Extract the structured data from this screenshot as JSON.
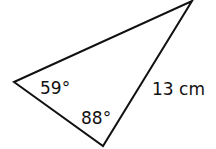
{
  "diagram": {
    "type": "triangle",
    "stroke_color": "#111111",
    "background": "#ffffff",
    "vertices": {
      "left": [
        14,
        82
      ],
      "top_right": [
        192,
        1
      ],
      "bottom": [
        103,
        146
      ]
    },
    "angles": [
      {
        "vertex": "left",
        "label": "59°"
      },
      {
        "vertex": "bottom",
        "label": "88°"
      }
    ],
    "sides": [
      {
        "between": [
          "top_right",
          "bottom"
        ],
        "label": "13 cm"
      }
    ]
  }
}
